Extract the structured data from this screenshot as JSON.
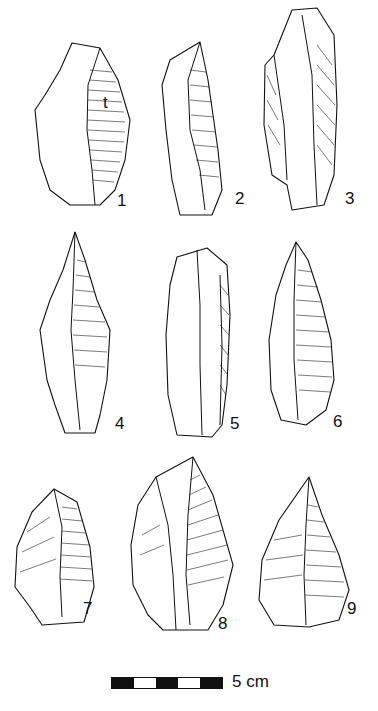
{
  "figure": {
    "type": "archaeological-illustration",
    "artifacts": [
      {
        "id": 1,
        "label": "1",
        "annotation": "t"
      },
      {
        "id": 2,
        "label": "2"
      },
      {
        "id": 3,
        "label": "3"
      },
      {
        "id": 4,
        "label": "4"
      },
      {
        "id": 5,
        "label": "5"
      },
      {
        "id": 6,
        "label": "6"
      },
      {
        "id": 7,
        "label": "7"
      },
      {
        "id": 8,
        "label": "8"
      },
      {
        "id": 9,
        "label": "9"
      }
    ],
    "scale_bar": {
      "label": "5 cm",
      "segments": [
        "black",
        "white",
        "black",
        "white",
        "black"
      ]
    }
  }
}
